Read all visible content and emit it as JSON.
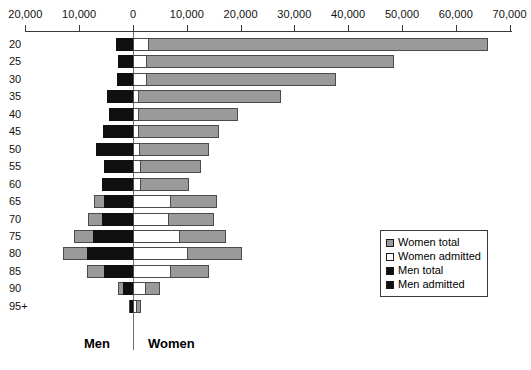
{
  "chart_data": {
    "type": "bar",
    "subtype": "population-pyramid",
    "title": "",
    "xlabel": "",
    "ylabel": "",
    "grid": false,
    "legend_position": "right-bottom",
    "axis": {
      "zero_value": 0,
      "left_max": 20000,
      "right_max": 70000,
      "tick_values": [
        20000,
        10000,
        0,
        10000,
        20000,
        30000,
        40000,
        50000,
        60000,
        70000
      ],
      "tick_labels": [
        "20,000",
        "10,000",
        "0",
        "10,000",
        "20,000",
        "30,000",
        "40,000",
        "50,000",
        "60,000",
        "70,000"
      ],
      "tick_signed": [
        -20000,
        -10000,
        0,
        10000,
        20000,
        30000,
        40000,
        50000,
        60000,
        70000
      ]
    },
    "categories": [
      "20",
      "25",
      "30",
      "35",
      "40",
      "45",
      "50",
      "55",
      "60",
      "65",
      "70",
      "75",
      "80",
      "85",
      "90",
      "95+"
    ],
    "side_labels": {
      "left": "Men",
      "right": "Women"
    },
    "series": [
      {
        "name": "Women total",
        "side": "right",
        "color": "#9a9a9a",
        "values": [
          66000,
          48500,
          37800,
          27500,
          19500,
          16000,
          14200,
          12700,
          10400,
          15600,
          15000,
          17200,
          20300,
          14100,
          5100,
          1500
        ]
      },
      {
        "name": "Women admitted",
        "side": "right",
        "color": "#ffffff",
        "values": [
          3000,
          2600,
          2600,
          1100,
          1100,
          1100,
          1300,
          1500,
          1500,
          7000,
          6700,
          8800,
          10200,
          7000,
          2400,
          700
        ]
      },
      {
        "name": "Men total",
        "side": "left",
        "color": "#9a9a9a",
        "values": [
          3100,
          2700,
          3000,
          4800,
          4500,
          5500,
          6900,
          5400,
          5700,
          7200,
          8300,
          11000,
          13100,
          8500,
          2800,
          800
        ]
      },
      {
        "name": "Men admitted",
        "side": "left",
        "color": "#101010",
        "values": [
          3100,
          2700,
          3000,
          4800,
          4500,
          5500,
          6900,
          5400,
          5700,
          5400,
          5800,
          7500,
          8600,
          5400,
          1800,
          500
        ]
      }
    ]
  },
  "legend": {
    "items": [
      {
        "label": "Women total",
        "swatch": "women-total"
      },
      {
        "label": "Women admitted",
        "swatch": "women-admitted"
      },
      {
        "label": "Men total",
        "swatch": "men-total"
      },
      {
        "label": "Men admitted",
        "swatch": "men-admitted"
      }
    ]
  },
  "footer": {
    "men_label": "Men",
    "women_label": "Women"
  }
}
